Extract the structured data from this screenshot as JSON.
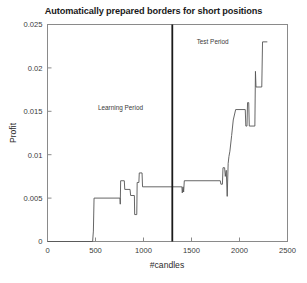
{
  "chart_data": {
    "type": "line",
    "title": "Automatically prepared borders for short positions",
    "xlabel": "#candles",
    "ylabel": "Profit",
    "xlim": [
      0,
      2500
    ],
    "ylim": [
      0,
      0.025
    ],
    "xticks": [
      0,
      500,
      1000,
      1500,
      2000,
      2500
    ],
    "xtick_labels": [
      "0",
      "500",
      "1000",
      "1500",
      "2000",
      "2500"
    ],
    "yticks": [
      0,
      0.005,
      0.01,
      0.015,
      0.02,
      0.025
    ],
    "ytick_labels": [
      "0",
      "0.005",
      "0.01",
      "0.015",
      "0.02",
      "0.025"
    ],
    "grid": false,
    "legend": false,
    "line_color": "#555555",
    "annotations": [
      {
        "text": "Learning Period",
        "x": 760,
        "y": 0.0152
      },
      {
        "text": "Test Period",
        "x": 1720,
        "y": 0.0228
      }
    ],
    "vertical_divider": {
      "x": 1300,
      "color": "#1a1a1a",
      "width": 1.8
    },
    "series": [
      {
        "name": "Profit",
        "step": "post",
        "points": [
          [
            0,
            0.0
          ],
          [
            470,
            0.0
          ],
          [
            478,
            0.0012
          ],
          [
            485,
            0.005
          ],
          [
            755,
            0.005
          ],
          [
            758,
            0.0043
          ],
          [
            762,
            0.007
          ],
          [
            800,
            0.007
          ],
          [
            805,
            0.006
          ],
          [
            860,
            0.006
          ],
          [
            866,
            0.0053
          ],
          [
            905,
            0.0053
          ],
          [
            908,
            0.0031
          ],
          [
            930,
            0.0031
          ],
          [
            934,
            0.0068
          ],
          [
            952,
            0.0068
          ],
          [
            956,
            0.0079
          ],
          [
            985,
            0.0079
          ],
          [
            990,
            0.0063
          ],
          [
            1400,
            0.0063
          ],
          [
            1404,
            0.0056
          ],
          [
            1412,
            0.0063
          ],
          [
            1418,
            0.0057
          ],
          [
            1425,
            0.007
          ],
          [
            1800,
            0.007
          ],
          [
            1806,
            0.0066
          ],
          [
            1822,
            0.0066
          ],
          [
            1828,
            0.0085
          ],
          [
            1845,
            0.0085
          ],
          [
            1852,
            0.0075
          ],
          [
            1862,
            0.0082
          ],
          [
            1872,
            0.0052
          ],
          [
            1882,
            0.009
          ],
          [
            1890,
            0.0098
          ],
          [
            1900,
            0.0104
          ],
          [
            1918,
            0.0122
          ],
          [
            1935,
            0.014
          ],
          [
            1960,
            0.0152
          ],
          [
            2060,
            0.0152
          ],
          [
            2066,
            0.0133
          ],
          [
            2078,
            0.0133
          ],
          [
            2084,
            0.016
          ],
          [
            2096,
            0.016
          ],
          [
            2102,
            0.0133
          ],
          [
            2160,
            0.0133
          ],
          [
            2166,
            0.0196
          ],
          [
            2172,
            0.0178
          ],
          [
            2232,
            0.0178
          ],
          [
            2240,
            0.023
          ],
          [
            2290,
            0.023
          ]
        ]
      }
    ]
  }
}
